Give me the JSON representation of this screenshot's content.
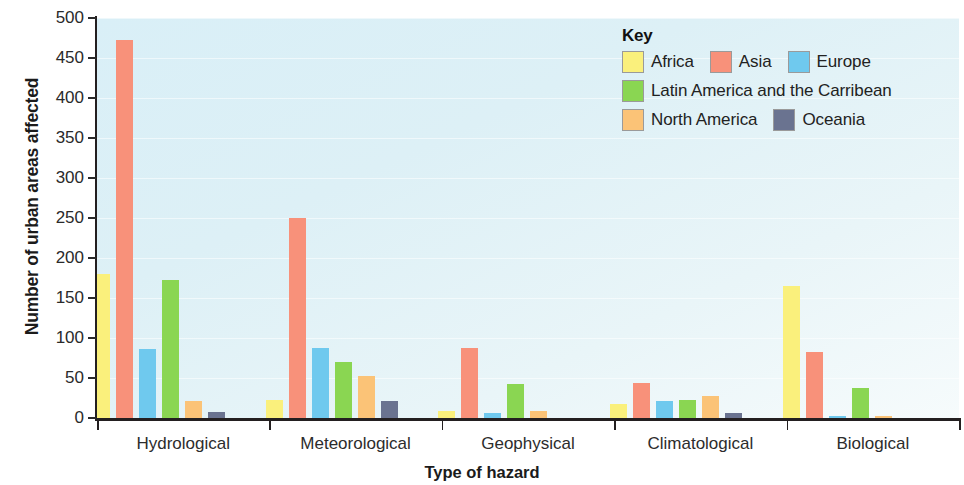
{
  "chart_data": {
    "type": "bar",
    "title": "",
    "xlabel": "Type of hazard",
    "ylabel": "Number of urban areas affected",
    "ylim": [
      0,
      500
    ],
    "ytick_step": 50,
    "yticks": [
      500,
      450,
      400,
      350,
      300,
      250,
      200,
      150,
      100,
      50,
      0
    ],
    "grid": true,
    "legend_position": "top-right",
    "legend_title": "Key",
    "categories": [
      "Hydrological",
      "Meteorological",
      "Geophysical",
      "Climatological",
      "Biological"
    ],
    "series": [
      {
        "name": "Africa",
        "color": "#faf07c",
        "values": [
          180,
          22,
          9,
          18,
          165
        ]
      },
      {
        "name": "Asia",
        "color": "#f8917a",
        "values": [
          472,
          250,
          87,
          44,
          83
        ]
      },
      {
        "name": "Europe",
        "color": "#6fc9ee",
        "values": [
          86,
          88,
          6,
          21,
          3
        ]
      },
      {
        "name": "Latin America and the Carribean",
        "color": "#8ad652",
        "values": [
          172,
          70,
          42,
          22,
          38
        ]
      },
      {
        "name": "North America",
        "color": "#fbc377",
        "values": [
          21,
          53,
          9,
          28,
          2
        ]
      },
      {
        "name": "Oceania",
        "color": "#6a7390",
        "values": [
          8,
          21,
          0,
          6,
          0
        ]
      }
    ]
  },
  "axes": {
    "y_title": "Number of urban areas affected",
    "x_title": "Type of hazard",
    "y_tick_labels": [
      "500",
      "450",
      "400",
      "350",
      "300",
      "250",
      "200",
      "150",
      "100",
      "50",
      "0"
    ],
    "x_tick_labels": [
      "Hydrological",
      "Meteorological",
      "Geophysical",
      "Climatological",
      "Biological"
    ]
  },
  "legend": {
    "title": "Key",
    "items": [
      {
        "label": "Africa",
        "color": "#faf07c"
      },
      {
        "label": "Asia",
        "color": "#f8917a"
      },
      {
        "label": "Europe",
        "color": "#6fc9ee"
      },
      {
        "label": "Latin America and the Carribean",
        "color": "#8ad652"
      },
      {
        "label": "North America",
        "color": "#fbc377"
      },
      {
        "label": "Oceania",
        "color": "#6a7390"
      }
    ]
  },
  "colors": {
    "plot_background": "#ddf0f6",
    "axis": "#231f20",
    "text": "#1b1b1b"
  }
}
